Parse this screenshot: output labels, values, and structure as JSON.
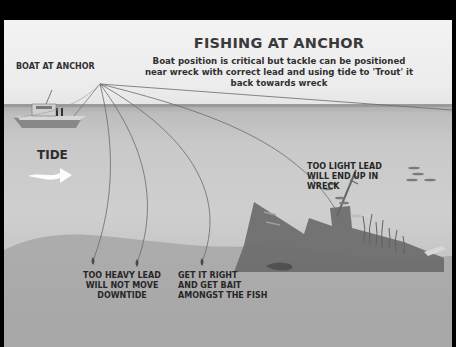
{
  "diagram": {
    "title": "FISHING AT ANCHOR",
    "subtitle": "Boat position is critical but tackle can be positioned near wreck with correct lead and using tide to 'Trout' it back towards wreck",
    "labels": {
      "boat": "BOAT AT ANCHOR",
      "tide": "TIDE",
      "too_light": [
        "TOO LIGHT LEAD",
        "WILL END UP IN",
        "WRECK"
      ],
      "too_heavy": [
        "TOO HEAVY LEAD",
        "WILL NOT MOVE",
        "DOWNTIDE"
      ],
      "get_it_right": [
        "GET IT RIGHT",
        "AND GET BAIT",
        "AMONGST THE FISH"
      ]
    },
    "colors": {
      "background": "#000000",
      "sky": "#efefef",
      "water": "#c8c8c8",
      "seabed": "#a3a3a3",
      "wreck": "#6a6a6a",
      "text": "#2b2b2b"
    }
  }
}
